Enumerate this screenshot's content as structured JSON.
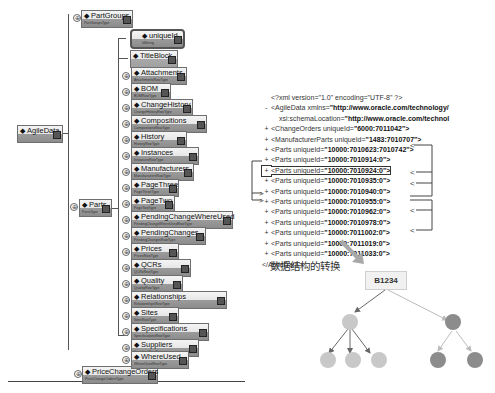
{
  "schema_tree": {
    "root": {
      "label": "AgileData",
      "sub": ""
    },
    "level1": [
      {
        "label": "PartGroups",
        "sub": "PartGroupsType"
      },
      {
        "label": "Parts",
        "sub": "PartsType"
      },
      {
        "label": "PriceChangeOrders",
        "sub": "PriceChangeOrdersType"
      }
    ],
    "parts_children": [
      {
        "label": "uniqueId",
        "sub": "IdString"
      },
      {
        "label": "TitleBlock",
        "sub": ""
      },
      {
        "label": "Attachments",
        "sub": "AttachmentsRowType"
      },
      {
        "label": "BOM",
        "sub": "BOMRowType"
      },
      {
        "label": "ChangeHistory",
        "sub": "ChangeHistoryRowType"
      },
      {
        "label": "Compositions",
        "sub": "CompositionsRowType"
      },
      {
        "label": "History",
        "sub": "HistoryRowType"
      },
      {
        "label": "Instances",
        "sub": "InstancesRowType"
      },
      {
        "label": "Manufacturers",
        "sub": "ManufacturersRowType"
      },
      {
        "label": "PageThree",
        "sub": "PageThreeType"
      },
      {
        "label": "PageTwo",
        "sub": "PageTwoType"
      },
      {
        "label": "PendingChangeWhereUsed",
        "sub": "PendingChangeWhereUsedRowType"
      },
      {
        "label": "PendingChanges",
        "sub": "PendingChangesRowType"
      },
      {
        "label": "Prices",
        "sub": "PricesRowType"
      },
      {
        "label": "QCRs",
        "sub": "QCRsRowType"
      },
      {
        "label": "Quality",
        "sub": "QualityRowType"
      },
      {
        "label": "Relationships",
        "sub": "RelationshipsRowType"
      },
      {
        "label": "Sites",
        "sub": "SitesRowType"
      },
      {
        "label": "Specifications",
        "sub": "SpecificationsRowType"
      },
      {
        "label": "Suppliers",
        "sub": "SuppliersRowType"
      },
      {
        "label": "WhereUsed",
        "sub": "WhereUsedRowType"
      }
    ]
  },
  "xml_listing": {
    "lines": [
      {
        "prefix": "",
        "text": "<?xml version=\"1.0\" encoding=\"UTF-8\" ?>",
        "value": ""
      },
      {
        "prefix": "-",
        "text": "<AgileData xmlns=",
        "value": "\"http://www.oracle.com/technology/"
      },
      {
        "prefix": "",
        "text": "xsi:schemaLocation=",
        "value": "\"http://www.oracle.com/technol"
      },
      {
        "prefix": "+",
        "text": "<ChangeOrders uniqueId=",
        "value": "\"6000:7011042\">"
      },
      {
        "prefix": "+",
        "text": "<ManufacturerParts uniqueId=",
        "value": "\"1483:7010707\">"
      },
      {
        "prefix": "+",
        "text": "<Parts uniqueId=",
        "value": "\"10000:7010623:7010742\">"
      },
      {
        "prefix": "+",
        "text": "<Parts uniqueId=",
        "value": "\"10000:7010914:0\">"
      },
      {
        "prefix": "+",
        "text": "<Parts uniqueId=",
        "value": "\"10000:7010924:0\">"
      },
      {
        "prefix": "+",
        "text": "<Parts uniqueId=",
        "value": "\"10000:7010935:0\">"
      },
      {
        "prefix": "+",
        "text": "<Parts uniqueId=",
        "value": "\"10000:7010940:0\">"
      },
      {
        "prefix": "+",
        "text": "<Parts uniqueId=",
        "value": "\"10000:7010955:0\">"
      },
      {
        "prefix": "+",
        "text": "<Parts uniqueId=",
        "value": "\"10000:7010962:0\">"
      },
      {
        "prefix": "+",
        "text": "<Parts uniqueId=",
        "value": "\"10000:7010978:0\">"
      },
      {
        "prefix": "+",
        "text": "<Parts uniqueId=",
        "value": "\"10000:7011002:0\">"
      },
      {
        "prefix": "+",
        "text": "<Parts uniqueId=",
        "value": "\"10000:7011019:0\">"
      },
      {
        "prefix": "+",
        "text": "<Parts uniqueId=",
        "value": "\"10000:7011033:0\">"
      },
      {
        "prefix": "",
        "text": "</AgileData>",
        "value": ""
      }
    ]
  },
  "transform": {
    "caption": "数据结构的转换",
    "root_node_label": "B1234"
  },
  "colors": {
    "node_light": "#c8c8c8",
    "node_dark": "#8c8c8c",
    "line": "#555555"
  }
}
